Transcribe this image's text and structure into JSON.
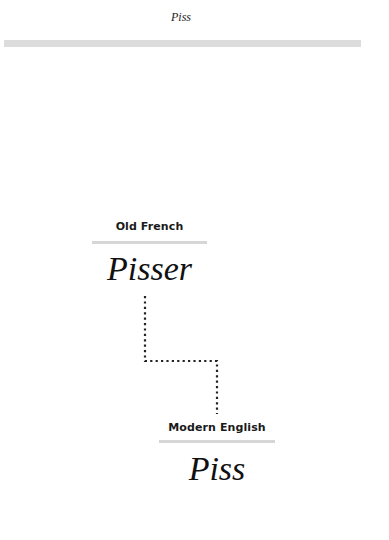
{
  "header": {
    "title": "Piss"
  },
  "diagram": {
    "type": "etymology-chain",
    "stages": [
      {
        "language": "Old French",
        "word": "Pisser"
      },
      {
        "language": "Modern English",
        "word": "Piss"
      }
    ],
    "colors": {
      "rule": "#d6d6d6",
      "header_bar": "#dcdcdc",
      "connector": "#222222",
      "text": "#111111"
    }
  }
}
